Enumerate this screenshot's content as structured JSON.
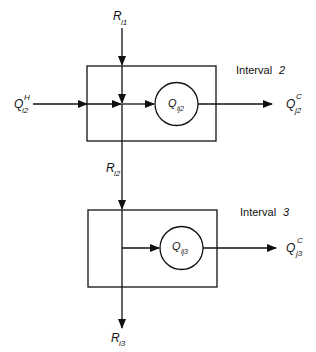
{
  "diagram": {
    "type": "heat-cascade-flow",
    "colors": {
      "stroke": "#111111",
      "background": "#ffffff"
    },
    "intervals": [
      {
        "label": "Interval",
        "number": "2",
        "inflow_residual": {
          "symbol": "R",
          "subscript": "i1"
        },
        "hot_input": {
          "symbol": "Q",
          "superscript": "H",
          "subscript": "i2"
        },
        "exchange": {
          "symbol": "Q",
          "subscript": "ij2"
        },
        "cold_output": {
          "symbol": "Q",
          "superscript": "C",
          "subscript": "j2"
        },
        "outflow_residual": {
          "symbol": "R",
          "subscript": "i2"
        }
      },
      {
        "label": "Interval",
        "number": "3",
        "exchange": {
          "symbol": "Q",
          "subscript": "ij3"
        },
        "cold_output": {
          "symbol": "Q",
          "superscript": "C",
          "subscript": "j3"
        },
        "outflow_residual": {
          "symbol": "R",
          "subscript": "i3"
        }
      }
    ]
  }
}
